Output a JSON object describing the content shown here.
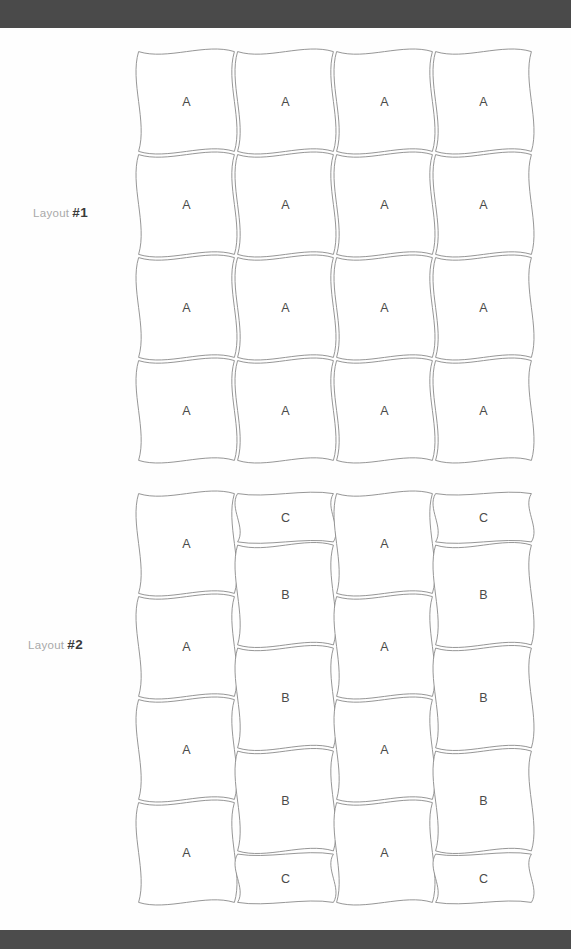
{
  "page": {
    "width": 571,
    "height": 949,
    "background": "#ffffff",
    "topbar_color": "#4a4a4a",
    "bottombar_color": "#4c4c4c",
    "line_color": "#8a8a8a",
    "letter_color": "#4a4a4a",
    "label_word_color": "#a9a9a9",
    "label_num_color": "#3a3a3a"
  },
  "layouts": [
    {
      "id": "layout-1",
      "label_word": "Layout",
      "label_num": "#1",
      "label_full": "Layout #1",
      "origin_x": 137,
      "origin_y": 50,
      "cell_w": 99,
      "cell_h": 103,
      "cols": 4,
      "rows": 4,
      "columns": [
        {
          "index": 0,
          "tiles": [
            {
              "letter": "A",
              "rows": 1
            },
            {
              "letter": "A",
              "rows": 1
            },
            {
              "letter": "A",
              "rows": 1
            },
            {
              "letter": "A",
              "rows": 1
            }
          ]
        },
        {
          "index": 1,
          "tiles": [
            {
              "letter": "A",
              "rows": 1
            },
            {
              "letter": "A",
              "rows": 1
            },
            {
              "letter": "A",
              "rows": 1
            },
            {
              "letter": "A",
              "rows": 1
            }
          ]
        },
        {
          "index": 2,
          "tiles": [
            {
              "letter": "A",
              "rows": 1
            },
            {
              "letter": "A",
              "rows": 1
            },
            {
              "letter": "A",
              "rows": 1
            },
            {
              "letter": "A",
              "rows": 1
            }
          ]
        },
        {
          "index": 3,
          "tiles": [
            {
              "letter": "A",
              "rows": 1
            },
            {
              "letter": "A",
              "rows": 1
            },
            {
              "letter": "A",
              "rows": 1
            },
            {
              "letter": "A",
              "rows": 1
            }
          ]
        }
      ]
    },
    {
      "id": "layout-2",
      "label_word": "Layout",
      "label_num": "#2",
      "label_full": "Layout #2",
      "origin_x": 137,
      "origin_y": 492,
      "cell_w": 99,
      "cell_h": 103,
      "cols": 4,
      "rows": 4,
      "columns": [
        {
          "index": 0,
          "tiles": [
            {
              "letter": "A",
              "rows": 1
            },
            {
              "letter": "A",
              "rows": 1
            },
            {
              "letter": "A",
              "rows": 1
            },
            {
              "letter": "A",
              "rows": 1
            }
          ]
        },
        {
          "index": 1,
          "tiles": [
            {
              "letter": "C",
              "rows": 0.5
            },
            {
              "letter": "B",
              "rows": 1
            },
            {
              "letter": "B",
              "rows": 1
            },
            {
              "letter": "B",
              "rows": 1
            },
            {
              "letter": "C",
              "rows": 0.5
            }
          ]
        },
        {
          "index": 2,
          "tiles": [
            {
              "letter": "A",
              "rows": 1
            },
            {
              "letter": "A",
              "rows": 1
            },
            {
              "letter": "A",
              "rows": 1
            },
            {
              "letter": "A",
              "rows": 1
            }
          ]
        },
        {
          "index": 3,
          "tiles": [
            {
              "letter": "C",
              "rows": 0.5
            },
            {
              "letter": "B",
              "rows": 1
            },
            {
              "letter": "B",
              "rows": 1
            },
            {
              "letter": "B",
              "rows": 1
            },
            {
              "letter": "C",
              "rows": 0.5
            }
          ]
        }
      ]
    }
  ],
  "labels": [
    {
      "for": "layout-1",
      "word": "Layout",
      "num": "#1",
      "x": 33,
      "y": 205
    },
    {
      "for": "layout-2",
      "word": "Layout",
      "num": "#2",
      "x": 28,
      "y": 637
    }
  ]
}
